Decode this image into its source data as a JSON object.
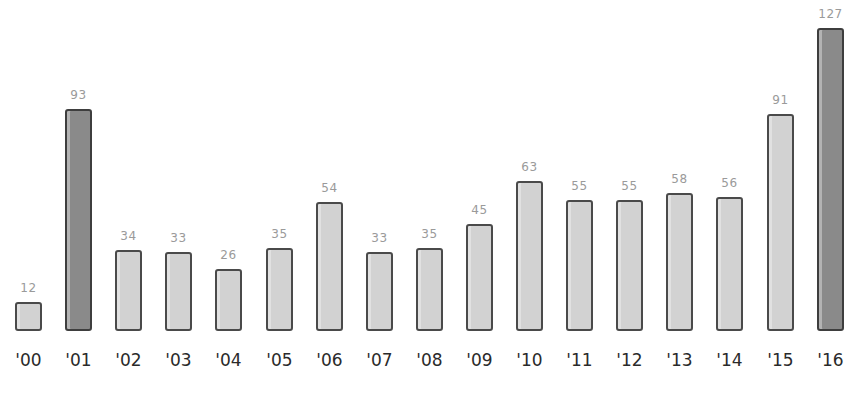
{
  "chart_data": {
    "type": "bar",
    "title": "",
    "xlabel": "",
    "ylabel": "",
    "categories": [
      "'00",
      "'01",
      "'02",
      "'03",
      "'04",
      "'05",
      "'06",
      "'07",
      "'08",
      "'09",
      "'10",
      "'11",
      "'12",
      "'13",
      "'14",
      "'15",
      "'16"
    ],
    "values": [
      12,
      93,
      34,
      33,
      26,
      35,
      54,
      33,
      35,
      45,
      63,
      55,
      55,
      58,
      56,
      91,
      127
    ],
    "highlighted": [
      "'01",
      "'16"
    ],
    "colors": {
      "bar": "#d2d2d2",
      "highlight": "#8a8a8a",
      "outline": "#4a4a4a",
      "value_label": "#9a9a9a",
      "category_label": "#2a2a2a"
    },
    "ylim": [
      0,
      127
    ],
    "grid": false,
    "legend": null,
    "data_labels": true
  }
}
